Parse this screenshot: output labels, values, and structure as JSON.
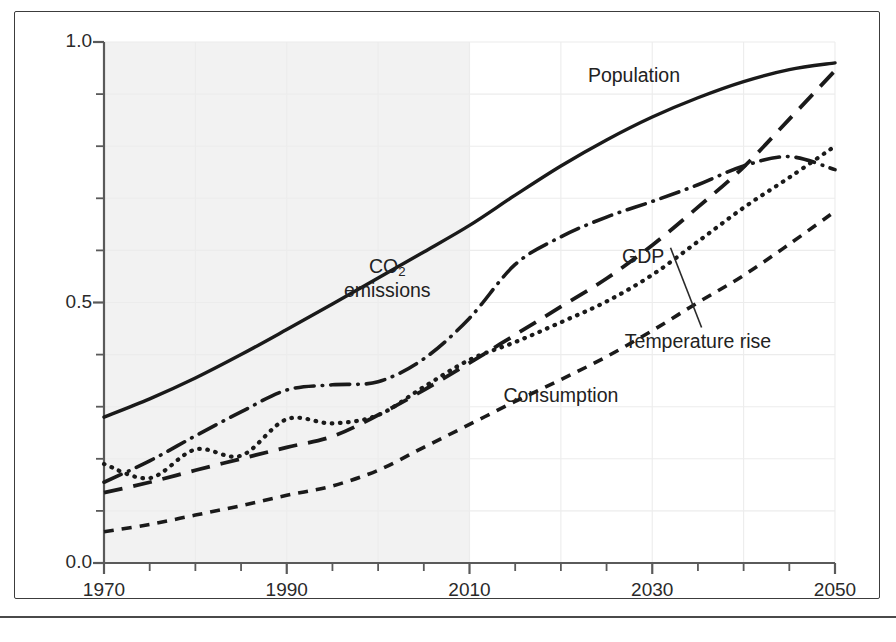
{
  "chart_data": {
    "type": "line",
    "title": "",
    "subtitle": "",
    "xlabel": "",
    "ylabel": "",
    "xlim": [
      1970,
      2050
    ],
    "ylim": [
      0.0,
      1.0
    ],
    "grid": true,
    "legend_position": "inline-annotations",
    "x_tick_labels": [
      "1970",
      "1990",
      "2010",
      "2030",
      "2050"
    ],
    "x_tick_values": [
      1970,
      1990,
      2010,
      2030,
      2050
    ],
    "x_minor_tick_step": 5,
    "y_tick_labels": [
      "0.0",
      "0.5",
      "1.0"
    ],
    "y_tick_values": [
      0.0,
      0.5,
      1.0
    ],
    "y_minor_tick_step": 0.1,
    "shaded_region": {
      "label": "historical",
      "x_start": 1970,
      "x_end": 2010,
      "color": "#f2f2f2"
    },
    "x": [
      1970,
      1975,
      1980,
      1985,
      1990,
      1995,
      2000,
      2005,
      2010,
      2015,
      2020,
      2025,
      2030,
      2035,
      2040,
      2045,
      2050
    ],
    "series": [
      {
        "name": "Population",
        "label": "Population",
        "style": "solid",
        "color": "#1a1a1a",
        "values": [
          0.28,
          0.315,
          0.355,
          0.4,
          0.448,
          0.497,
          0.547,
          0.597,
          0.648,
          0.706,
          0.762,
          0.812,
          0.856,
          0.893,
          0.924,
          0.947,
          0.96
        ]
      },
      {
        "name": "CO2 emissions",
        "label": "CO₂ emissions",
        "style": "dash-dot",
        "color": "#1a1a1a",
        "values": [
          0.155,
          0.196,
          0.244,
          0.29,
          0.332,
          0.342,
          0.348,
          0.392,
          0.47,
          0.573,
          0.626,
          0.664,
          0.694,
          0.726,
          0.762,
          0.78,
          0.755
        ]
      },
      {
        "name": "GDP",
        "label": "GDP",
        "style": "long-dash",
        "color": "#1a1a1a",
        "values": [
          0.135,
          0.155,
          0.178,
          0.2,
          0.222,
          0.243,
          0.284,
          0.332,
          0.384,
          0.438,
          0.492,
          0.546,
          0.61,
          0.683,
          0.76,
          0.852,
          0.945
        ]
      },
      {
        "name": "Temperature rise",
        "label": "Temperature rise",
        "style": "dotted",
        "color": "#1a1a1a",
        "values": [
          0.19,
          0.163,
          0.218,
          0.206,
          0.276,
          0.268,
          0.284,
          0.338,
          0.39,
          0.424,
          0.462,
          0.502,
          0.553,
          0.617,
          0.682,
          0.74,
          0.8
        ]
      },
      {
        "name": "Consumption",
        "label": "Consumption",
        "style": "short-dash",
        "color": "#1a1a1a",
        "values": [
          0.06,
          0.074,
          0.092,
          0.11,
          0.13,
          0.148,
          0.178,
          0.222,
          0.266,
          0.31,
          0.352,
          0.396,
          0.446,
          0.5,
          0.552,
          0.612,
          0.675
        ]
      }
    ],
    "annotations": [
      {
        "name": "population-label",
        "text": "Population",
        "x": 2028,
        "y": 0.935
      },
      {
        "name": "co2-emissions-label",
        "text": "CO₂ emissions",
        "x": 2001,
        "y": 0.545
      },
      {
        "name": "gdp-label",
        "text": "GDP",
        "x": 2029,
        "y": 0.588
      },
      {
        "name": "temperature-rise-label",
        "text": "Temperature rise",
        "x": 2035,
        "y": 0.425,
        "leader_line": true
      },
      {
        "name": "consumption-label",
        "text": "Consumption",
        "x": 2020,
        "y": 0.32
      }
    ]
  },
  "figure": {
    "background_color": "#ffffff",
    "frame_color": "#3c3c3c",
    "gridline_color": "#ececec",
    "axis_color": "#5a5a5a",
    "text_color": "#222222"
  }
}
